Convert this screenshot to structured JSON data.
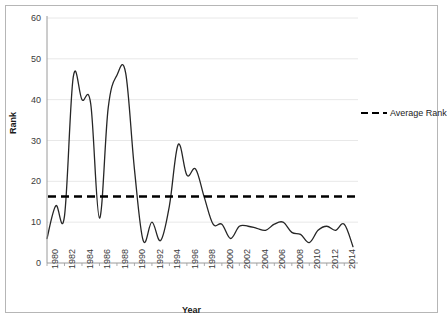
{
  "chart_data": {
    "type": "line",
    "title": "",
    "xlabel": "Year",
    "ylabel": "Rank",
    "xlim": [
      1980,
      2015
    ],
    "ylim": [
      0,
      60
    ],
    "ytick_step": 10,
    "xtick_step": 2,
    "grid": "horizontal",
    "legend_position": "right",
    "y_ticks": [
      "0",
      "10",
      "20",
      "30",
      "40",
      "50",
      "60"
    ],
    "x_ticks": [
      "1980",
      "1982",
      "1984",
      "1986",
      "1988",
      "1990",
      "1992",
      "1994",
      "1996",
      "1998",
      "2000",
      "2002",
      "2004",
      "2006",
      "2008",
      "2010",
      "2012",
      "2014"
    ],
    "x": [
      1980,
      1981,
      1982,
      1983,
      1984,
      1985,
      1986,
      1987,
      1988,
      1989,
      1990,
      1991,
      1992,
      1993,
      1994,
      1995,
      1996,
      1997,
      1998,
      1999,
      2000,
      2001,
      2002,
      2003,
      2004,
      2005,
      2006,
      2007,
      2008,
      2009,
      2010,
      2011,
      2012,
      2013,
      2014,
      2015
    ],
    "series": [
      {
        "name": "Rank",
        "style": "solid",
        "color": "#262626",
        "values": [
          6,
          14,
          11.5,
          45.5,
          40,
          39,
          11,
          38,
          46,
          46.5,
          23,
          5.5,
          10,
          5.5,
          14,
          29,
          21.5,
          23,
          16,
          9.5,
          9.5,
          6,
          9,
          9,
          8.5,
          8,
          9.5,
          10,
          7.5,
          7,
          5,
          8,
          9,
          8,
          9.5,
          4
        ]
      },
      {
        "name": "Average Rank",
        "style": "dashed",
        "color": "#000000",
        "constant_value": 16.3
      }
    ],
    "legend": [
      {
        "label": "Average Rank",
        "style": "dashed",
        "color": "#000000"
      }
    ]
  },
  "colors": {
    "line": "#262626",
    "average_line": "#000000",
    "grid": "#e8e8e8",
    "axis": "#9a9a9a",
    "border": "#b6b6b6",
    "text": "#3a3a3a"
  }
}
